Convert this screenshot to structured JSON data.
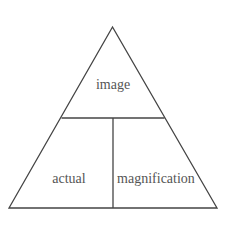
{
  "diagram": {
    "type": "formula-triangle",
    "labels": {
      "top": "image",
      "bottom_left": "actual",
      "bottom_right": "magnification"
    },
    "colors": {
      "line": "#444444",
      "text": "#555555",
      "background": "#ffffff"
    }
  }
}
